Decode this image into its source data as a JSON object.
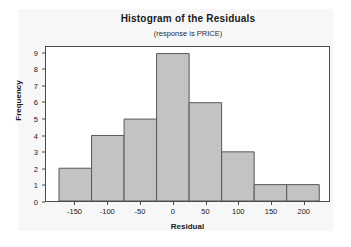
{
  "chart_data": {
    "type": "bar",
    "title": "Histogram of the Residuals",
    "subtitle": "(response is PRICE)",
    "xlabel": "Residual",
    "ylabel": "Frequency",
    "bin_width": 50,
    "bin_centers": [
      -150,
      -100,
      -50,
      0,
      50,
      100,
      150,
      200
    ],
    "categories": [
      "-150",
      "-100",
      "-50",
      "0",
      "50",
      "100",
      "150",
      "200"
    ],
    "values": [
      2,
      4,
      5,
      9,
      6,
      3,
      1,
      1
    ],
    "bin_edges": [
      -175,
      -125,
      -75,
      -25,
      25,
      75,
      125,
      175,
      225
    ],
    "total_count": 31,
    "xlim": [
      -195,
      240
    ],
    "ylim": [
      0,
      9.4
    ],
    "xticks": [
      -150,
      -100,
      -50,
      0,
      50,
      100,
      150,
      200
    ],
    "xtick_labels": [
      "-150",
      "-100",
      "-50",
      "0",
      "50",
      "100",
      "150",
      "200"
    ],
    "yticks": [
      0,
      1,
      2,
      3,
      4,
      5,
      6,
      7,
      8,
      9
    ],
    "ytick_labels": [
      "0",
      "1",
      "2",
      "3",
      "4",
      "5",
      "6",
      "7",
      "8",
      "9"
    ],
    "grid": false,
    "legend": "none",
    "bar_fill": "#c3c3c3",
    "bar_edge": "#575757",
    "frame_color": "#4a4a4a",
    "plot_background": "#ffffff",
    "panel_background": "#f7f7f7",
    "text_color": "#1a1a1a"
  }
}
